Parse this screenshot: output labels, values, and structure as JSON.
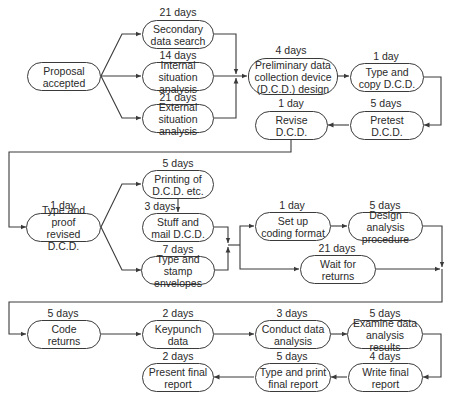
{
  "diagram": {
    "type": "activity-network",
    "nodes": [
      {
        "id": "proposal",
        "label": "Proposal\naccepted",
        "duration": ""
      },
      {
        "id": "secondary",
        "label": "Secondary\ndata search",
        "duration": "21 days"
      },
      {
        "id": "internal",
        "label": "Internal situation\nanalysis",
        "duration": "14 days"
      },
      {
        "id": "external",
        "label": "External situation\nanalysis",
        "duration": "21 days"
      },
      {
        "id": "prelim",
        "label": "Preliminary data\ncollection device\n(D.C.D.) design",
        "duration": "4 days"
      },
      {
        "id": "typecopy",
        "label": "Type and\ncopy D.C.D.",
        "duration": "1 day"
      },
      {
        "id": "pretest",
        "label": "Pretest\nD.C.D.",
        "duration": "5 days"
      },
      {
        "id": "revise",
        "label": "Revise\nD.C.D.",
        "duration": "1 day"
      },
      {
        "id": "typeproof",
        "label": "Type and proof\nrevised D.C.D.",
        "duration": "1 day"
      },
      {
        "id": "printing",
        "label": "Printing of\nD.C.D. etc.",
        "duration": "5 days"
      },
      {
        "id": "stuff",
        "label": "Stuff and\nmail D.C.D.",
        "duration": "3 days"
      },
      {
        "id": "stamp",
        "label": "Type and\nstamp envelopes",
        "duration": "7 days"
      },
      {
        "id": "setup",
        "label": "Set up\ncoding format",
        "duration": "1 day"
      },
      {
        "id": "design",
        "label": "Design analysis\nprocedure",
        "duration": "5 days"
      },
      {
        "id": "wait",
        "label": "Wait for\nreturns",
        "duration": "21 days"
      },
      {
        "id": "code",
        "label": "Code\nreturns",
        "duration": "5 days"
      },
      {
        "id": "keypunch",
        "label": "Keypunch\ndata",
        "duration": "2 days"
      },
      {
        "id": "conduct",
        "label": "Conduct data\nanalysis",
        "duration": "3 days"
      },
      {
        "id": "examine",
        "label": "Examine data\nanalysis results",
        "duration": "5 days"
      },
      {
        "id": "write",
        "label": "Write final\nreport",
        "duration": "4 days"
      },
      {
        "id": "typeprint",
        "label": "Type and print\nfinal report",
        "duration": "5 days"
      },
      {
        "id": "present",
        "label": "Present final\nreport",
        "duration": "2 days"
      }
    ],
    "edges": [
      [
        "proposal",
        "secondary"
      ],
      [
        "proposal",
        "internal"
      ],
      [
        "proposal",
        "external"
      ],
      [
        "secondary",
        "prelim"
      ],
      [
        "internal",
        "prelim"
      ],
      [
        "external",
        "prelim"
      ],
      [
        "prelim",
        "typecopy"
      ],
      [
        "typecopy",
        "pretest"
      ],
      [
        "pretest",
        "revise"
      ],
      [
        "revise",
        "typeproof"
      ],
      [
        "typeproof",
        "printing"
      ],
      [
        "typeproof",
        "stamp"
      ],
      [
        "printing",
        "stuff"
      ],
      [
        "stuff",
        "setup"
      ],
      [
        "stamp",
        "setup"
      ],
      [
        "stuff",
        "wait"
      ],
      [
        "stamp",
        "wait"
      ],
      [
        "setup",
        "design"
      ],
      [
        "design",
        "code"
      ],
      [
        "wait",
        "code"
      ],
      [
        "code",
        "keypunch"
      ],
      [
        "keypunch",
        "conduct"
      ],
      [
        "conduct",
        "examine"
      ],
      [
        "examine",
        "write"
      ],
      [
        "write",
        "typeprint"
      ],
      [
        "typeprint",
        "present"
      ]
    ],
    "colors": {
      "line": "#3a3a3a",
      "text": "#2a2a2a",
      "background": "#ffffff"
    }
  }
}
